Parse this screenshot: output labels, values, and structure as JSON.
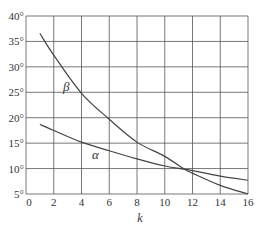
{
  "chart_data": {
    "type": "line",
    "title": "",
    "xlabel": "k",
    "ylabel": "",
    "xlim": [
      0,
      16
    ],
    "ylim": [
      5,
      40
    ],
    "grid": true,
    "legend": "none (inline curve labels)",
    "x_ticks": [
      "0",
      "2",
      "4",
      "6",
      "8",
      "10",
      "12",
      "14",
      "16"
    ],
    "y_ticks": [
      "5°",
      "10°",
      "15°",
      "20°",
      "25°",
      "30°",
      "35°",
      "40°"
    ],
    "series": [
      {
        "name": "β",
        "x": [
          1,
          2,
          4,
          6,
          8,
          10,
          11.4,
          12,
          14,
          16
        ],
        "values": [
          36.6,
          32.3,
          24.8,
          19.7,
          15.2,
          12.4,
          9.9,
          9.1,
          6.7,
          5.0
        ],
        "label_position": {
          "x": 63,
          "y": 91
        }
      },
      {
        "name": "α",
        "x": [
          1,
          2,
          4,
          6,
          8,
          10,
          11.4,
          12,
          14,
          16
        ],
        "values": [
          18.7,
          17.5,
          15.2,
          13.5,
          11.9,
          10.5,
          9.9,
          9.6,
          8.5,
          7.7
        ],
        "label_position": {
          "x": 92,
          "y": 159
        }
      }
    ],
    "annotations": [
      {
        "text": "intersection of α and β near k≈11.4, angle≈9.9°"
      }
    ]
  },
  "colors": {
    "grid": "#555555",
    "curve": "#444444",
    "text": "#333333",
    "background": "#ffffff"
  }
}
